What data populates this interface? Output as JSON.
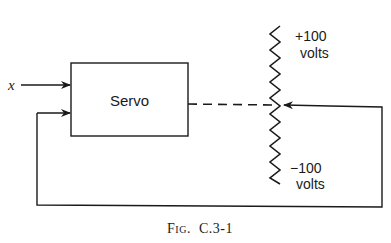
{
  "diagram": {
    "input_label": "x",
    "block_label": "Servo",
    "potentiometer": {
      "top_label_value": "+100",
      "top_label_unit": "volts",
      "bottom_label_value": "−100",
      "bottom_label_unit": "volts"
    },
    "caption": "Fig. C.3-1",
    "caption_prefix": "Fig.",
    "caption_id": "C.3-1",
    "colors": {
      "line": "#1a1a1a",
      "background": "#ffffff"
    }
  }
}
